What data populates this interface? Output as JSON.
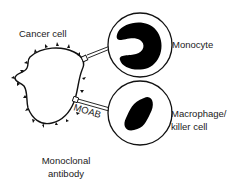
{
  "diagram": {
    "type": "biology-illustration",
    "labels": {
      "cancer_cell": "Cancer cell",
      "monocyte": "Monocyte",
      "macrophage_line1": "Macrophage/",
      "macrophage_line2": "killer cell",
      "moab": "MOAB",
      "antibody_line1": "Monoclonal",
      "antibody_line2": "antibody"
    },
    "colors": {
      "stroke": "#111111",
      "nucleus_fill": "#000000",
      "background": "#ffffff"
    },
    "nodes": [
      {
        "id": "cancer-cell",
        "label": "Cancer cell",
        "shape": "spiky-blob"
      },
      {
        "id": "monocyte",
        "label": "Monocyte",
        "shape": "circle",
        "nucleus": "c-shaped"
      },
      {
        "id": "macrophage",
        "label": "Macrophage/ killer cell",
        "shape": "circle",
        "nucleus": "bean-shaped"
      }
    ],
    "edges": [
      {
        "from": "cancer-cell",
        "to": "monocyte",
        "style": "double-line antibody bridge"
      },
      {
        "from": "cancer-cell",
        "to": "macrophage",
        "style": "double-line antibody bridge",
        "label": "MOAB"
      }
    ]
  }
}
